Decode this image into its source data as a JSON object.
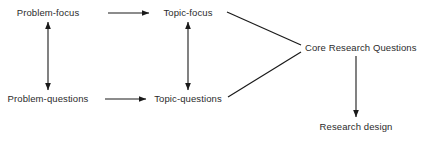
{
  "diagram": {
    "background_color": "#ffffff",
    "line_color": "#1a1a1a",
    "text_color": "#2b2b2b",
    "nodes": [
      {
        "id": "problem-focus",
        "label": "Problem-focus",
        "x": 48,
        "y": 13,
        "align": "center"
      },
      {
        "id": "topic-focus",
        "label": "Topic-focus",
        "x": 188,
        "y": 13,
        "align": "center"
      },
      {
        "id": "problem-questions",
        "label": "Problem-questions",
        "x": 48,
        "y": 99,
        "align": "center"
      },
      {
        "id": "topic-questions",
        "label": "Topic-questions",
        "x": 188,
        "y": 99,
        "align": "center"
      },
      {
        "id": "core-research-questions",
        "label": "Core Research Questions",
        "x": 305,
        "y": 48,
        "align": "left"
      },
      {
        "id": "research-design",
        "label": "Research design",
        "x": 356,
        "y": 127,
        "align": "center"
      }
    ],
    "edges": [
      {
        "id": "problem-focus-to-topic-focus",
        "from": "problem-focus",
        "to": "topic-focus",
        "kind": "arrow-right"
      },
      {
        "id": "problem-questions-to-topic-questions",
        "from": "problem-questions",
        "to": "topic-questions",
        "kind": "arrow-right"
      },
      {
        "id": "problem-focus-problem-questions",
        "from": "problem-focus",
        "to": "problem-questions",
        "kind": "arrow-double-vertical"
      },
      {
        "id": "topic-focus-topic-questions",
        "from": "topic-focus",
        "to": "topic-questions",
        "kind": "arrow-double-vertical"
      },
      {
        "id": "topic-focus-to-core",
        "from": "topic-focus",
        "to": "core-research-questions",
        "kind": "line-diagonal"
      },
      {
        "id": "topic-questions-to-core",
        "from": "topic-questions",
        "to": "core-research-questions",
        "kind": "line-diagonal"
      },
      {
        "id": "core-to-research-design",
        "from": "core-research-questions",
        "to": "research-design",
        "kind": "arrow-down"
      }
    ]
  }
}
